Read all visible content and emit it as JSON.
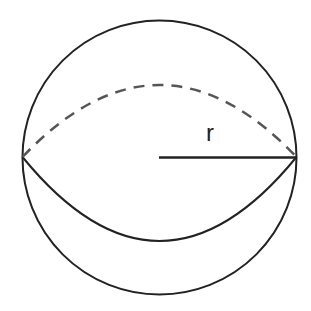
{
  "diagram": {
    "type": "sphere",
    "radius_label": "r",
    "colors": {
      "stroke": "#222222",
      "dashed": "#555555",
      "background": "#ffffff"
    }
  }
}
